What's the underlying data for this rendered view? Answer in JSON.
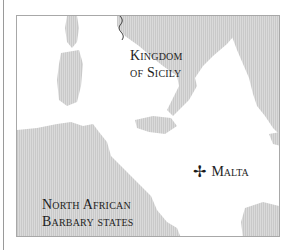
{
  "map": {
    "labels": {
      "sicily_line1": "Kingdom",
      "sicily_line2": "of Sicily",
      "malta": "Malta",
      "africa_line1": "North African",
      "africa_line2": "Barbary states"
    },
    "icons": {
      "malta_marker": "✢"
    },
    "colors": {
      "land": "#d2d2d2",
      "sea": "#ffffff",
      "frame": "#a8a8a8",
      "text": "#1e1e1e"
    }
  }
}
